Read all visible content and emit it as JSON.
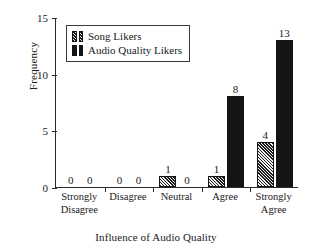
{
  "chart_data": {
    "type": "bar",
    "title": "",
    "xlabel": "Influence of Audio Quality",
    "ylabel": "Frequency",
    "categories": [
      "Strongly Disagree",
      "Disagree",
      "Neutral",
      "Agree",
      "Strongly Agree"
    ],
    "category_lines": [
      [
        "Strongly",
        "Disagree"
      ],
      [
        "Disagree",
        ""
      ],
      [
        "Neutral",
        ""
      ],
      [
        "Agree",
        ""
      ],
      [
        "Strongly",
        "Agree"
      ]
    ],
    "series": [
      {
        "name": "Song Likers",
        "pattern": "diagonal-hatch",
        "color": "#1c1c1c",
        "values": [
          0,
          0,
          1,
          1,
          4
        ]
      },
      {
        "name": "Audio Quality Likers",
        "pattern": "solid",
        "color": "#141414",
        "values": [
          0,
          0,
          0,
          8,
          13
        ]
      }
    ],
    "value_labels": [
      [
        "0",
        "0"
      ],
      [
        "0",
        "0"
      ],
      [
        "1",
        "0"
      ],
      [
        "1",
        "8"
      ],
      [
        "4",
        "13"
      ]
    ],
    "ylim": [
      0,
      15
    ],
    "yticks": [
      0,
      5,
      10,
      15
    ],
    "ytick_labels": [
      "0",
      "5",
      "10",
      "15"
    ],
    "grid": false,
    "legend_position": "top-left-inside"
  },
  "legend": {
    "entries": [
      {
        "label": "Song Likers"
      },
      {
        "label": "Audio Quality Likers"
      }
    ]
  }
}
